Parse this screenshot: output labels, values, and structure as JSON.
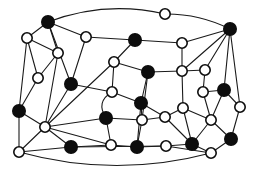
{
  "figure": {
    "type": "node-link-diagram",
    "width": 258,
    "height": 171,
    "background_color": "#ffffff",
    "edge_color": "#1a1a1a",
    "node_stroke_color": "#0d0d0d",
    "node_fill_black": "#0d0d0d",
    "node_fill_white": "#ffffff",
    "node_radius": 5.2,
    "node_radius_large": 6.2,
    "edge_width": 1.1,
    "node_count": 42,
    "edge_count": 78,
    "black_node_count": 18,
    "white_node_count": 24
  },
  "chart_data": {
    "type": "scatter",
    "xlabel": "",
    "ylabel": "",
    "xlim": [
      0,
      258
    ],
    "ylim": [
      0,
      171
    ],
    "grid": false,
    "legend": "none",
    "nodes": [
      {
        "id": "n0",
        "x": 48,
        "y": 22,
        "color": "black",
        "r": 6.2
      },
      {
        "id": "n1",
        "x": 165,
        "y": 14,
        "color": "white",
        "r": 5.2
      },
      {
        "id": "n2",
        "x": 230,
        "y": 29,
        "color": "black",
        "r": 6.2
      },
      {
        "id": "n3",
        "x": 27,
        "y": 38,
        "color": "white",
        "r": 5.2
      },
      {
        "id": "n4",
        "x": 86,
        "y": 37,
        "color": "white",
        "r": 5.2
      },
      {
        "id": "n5",
        "x": 135,
        "y": 40,
        "color": "black",
        "r": 6.2
      },
      {
        "id": "n6",
        "x": 182,
        "y": 43,
        "color": "white",
        "r": 5.2
      },
      {
        "id": "n7",
        "x": 58,
        "y": 53,
        "color": "white",
        "r": 5.2
      },
      {
        "id": "n8",
        "x": 38,
        "y": 78,
        "color": "white",
        "r": 5.2
      },
      {
        "id": "n9",
        "x": 114,
        "y": 62,
        "color": "white",
        "r": 5.2
      },
      {
        "id": "n10",
        "x": 148,
        "y": 72,
        "color": "black",
        "r": 6.2
      },
      {
        "id": "n11",
        "x": 182,
        "y": 71,
        "color": "white",
        "r": 5.2
      },
      {
        "id": "n12",
        "x": 205,
        "y": 70,
        "color": "white",
        "r": 5.2
      },
      {
        "id": "n13",
        "x": 71,
        "y": 84,
        "color": "black",
        "r": 6.2
      },
      {
        "id": "n14",
        "x": 112,
        "y": 92,
        "color": "white",
        "r": 5.2
      },
      {
        "id": "n15",
        "x": 224,
        "y": 90,
        "color": "black",
        "r": 6.2
      },
      {
        "id": "n16",
        "x": 203,
        "y": 92,
        "color": "white",
        "r": 5.2
      },
      {
        "id": "n17",
        "x": 19,
        "y": 111,
        "color": "black",
        "r": 6.2
      },
      {
        "id": "n18",
        "x": 141,
        "y": 103,
        "color": "black",
        "r": 6.2
      },
      {
        "id": "n19",
        "x": 183,
        "y": 108,
        "color": "white",
        "r": 5.2
      },
      {
        "id": "n20",
        "x": 240,
        "y": 107,
        "color": "white",
        "r": 5.2
      },
      {
        "id": "n21",
        "x": 106,
        "y": 118,
        "color": "black",
        "r": 6.2
      },
      {
        "id": "n22",
        "x": 142,
        "y": 120,
        "color": "white",
        "r": 5.2
      },
      {
        "id": "n23",
        "x": 165,
        "y": 117,
        "color": "white",
        "r": 5.2
      },
      {
        "id": "n24",
        "x": 211,
        "y": 120,
        "color": "white",
        "r": 5.2
      },
      {
        "id": "n25",
        "x": 45,
        "y": 127,
        "color": "white",
        "r": 5.2
      },
      {
        "id": "n26",
        "x": 19,
        "y": 152,
        "color": "white",
        "r": 5.2
      },
      {
        "id": "n27",
        "x": 71,
        "y": 147,
        "color": "black",
        "r": 6.2
      },
      {
        "id": "n28",
        "x": 111,
        "y": 145,
        "color": "white",
        "r": 5.2
      },
      {
        "id": "n29",
        "x": 137,
        "y": 147,
        "color": "black",
        "r": 6.2
      },
      {
        "id": "n30",
        "x": 166,
        "y": 146,
        "color": "white",
        "r": 5.2
      },
      {
        "id": "n31",
        "x": 192,
        "y": 144,
        "color": "black",
        "r": 6.2
      },
      {
        "id": "n32",
        "x": 211,
        "y": 153,
        "color": "white",
        "r": 5.2
      },
      {
        "id": "n33",
        "x": 231,
        "y": 139,
        "color": "black",
        "r": 6.2
      }
    ],
    "edges": [
      [
        "n0",
        "n3"
      ],
      [
        "n0",
        "n4"
      ],
      [
        "n0",
        "n7"
      ],
      [
        "n0",
        "n13"
      ],
      [
        "n1",
        "n2"
      ],
      [
        "n2",
        "n6"
      ],
      [
        "n2",
        "n11"
      ],
      [
        "n2",
        "n12"
      ],
      [
        "n2",
        "n15"
      ],
      [
        "n2",
        "n20"
      ],
      [
        "n3",
        "n7"
      ],
      [
        "n3",
        "n8"
      ],
      [
        "n3",
        "n17"
      ],
      [
        "n4",
        "n5"
      ],
      [
        "n4",
        "n13"
      ],
      [
        "n5",
        "n6"
      ],
      [
        "n5",
        "n9"
      ],
      [
        "n6",
        "n11"
      ],
      [
        "n7",
        "n8"
      ],
      [
        "n7",
        "n25"
      ],
      [
        "n8",
        "n17"
      ],
      [
        "n9",
        "n10"
      ],
      [
        "n9",
        "n14"
      ],
      [
        "n10",
        "n11"
      ],
      [
        "n10",
        "n18"
      ],
      [
        "n10",
        "n22"
      ],
      [
        "n11",
        "n12"
      ],
      [
        "n11",
        "n19"
      ],
      [
        "n12",
        "n16"
      ],
      [
        "n13",
        "n14"
      ],
      [
        "n14",
        "n18"
      ],
      [
        "n14",
        "n21"
      ],
      [
        "n15",
        "n16"
      ],
      [
        "n15",
        "n20"
      ],
      [
        "n15",
        "n24"
      ],
      [
        "n16",
        "n24"
      ],
      [
        "n17",
        "n25"
      ],
      [
        "n17",
        "n26"
      ],
      [
        "n18",
        "n22"
      ],
      [
        "n18",
        "n23"
      ],
      [
        "n18",
        "n29"
      ],
      [
        "n19",
        "n23"
      ],
      [
        "n19",
        "n24"
      ],
      [
        "n19",
        "n31"
      ],
      [
        "n20",
        "n33"
      ],
      [
        "n21",
        "n25"
      ],
      [
        "n21",
        "n22"
      ],
      [
        "n21",
        "n28"
      ],
      [
        "n22",
        "n23"
      ],
      [
        "n22",
        "n29"
      ],
      [
        "n23",
        "n31"
      ],
      [
        "n24",
        "n31"
      ],
      [
        "n24",
        "n33"
      ],
      [
        "n25",
        "n26"
      ],
      [
        "n25",
        "n27"
      ],
      [
        "n25",
        "n28"
      ],
      [
        "n26",
        "n27"
      ],
      [
        "n27",
        "n28"
      ],
      [
        "n27",
        "n30"
      ],
      [
        "n28",
        "n29"
      ],
      [
        "n29",
        "n30"
      ],
      [
        "n30",
        "n31"
      ],
      [
        "n30",
        "n32"
      ],
      [
        "n31",
        "n32"
      ],
      [
        "n32",
        "n33"
      ]
    ],
    "curved_edges": [
      {
        "from": "n0",
        "to": "n1",
        "bow": -9
      },
      {
        "from": "n1",
        "to": "n2",
        "bow": -4
      },
      {
        "from": "n14",
        "to": "n21",
        "bow": 7
      },
      {
        "from": "n26",
        "to": "n32",
        "bow": 13
      },
      {
        "from": "n25",
        "to": "n13",
        "bow": 0
      },
      {
        "from": "n25",
        "to": "n9",
        "bow": 0
      }
    ]
  }
}
